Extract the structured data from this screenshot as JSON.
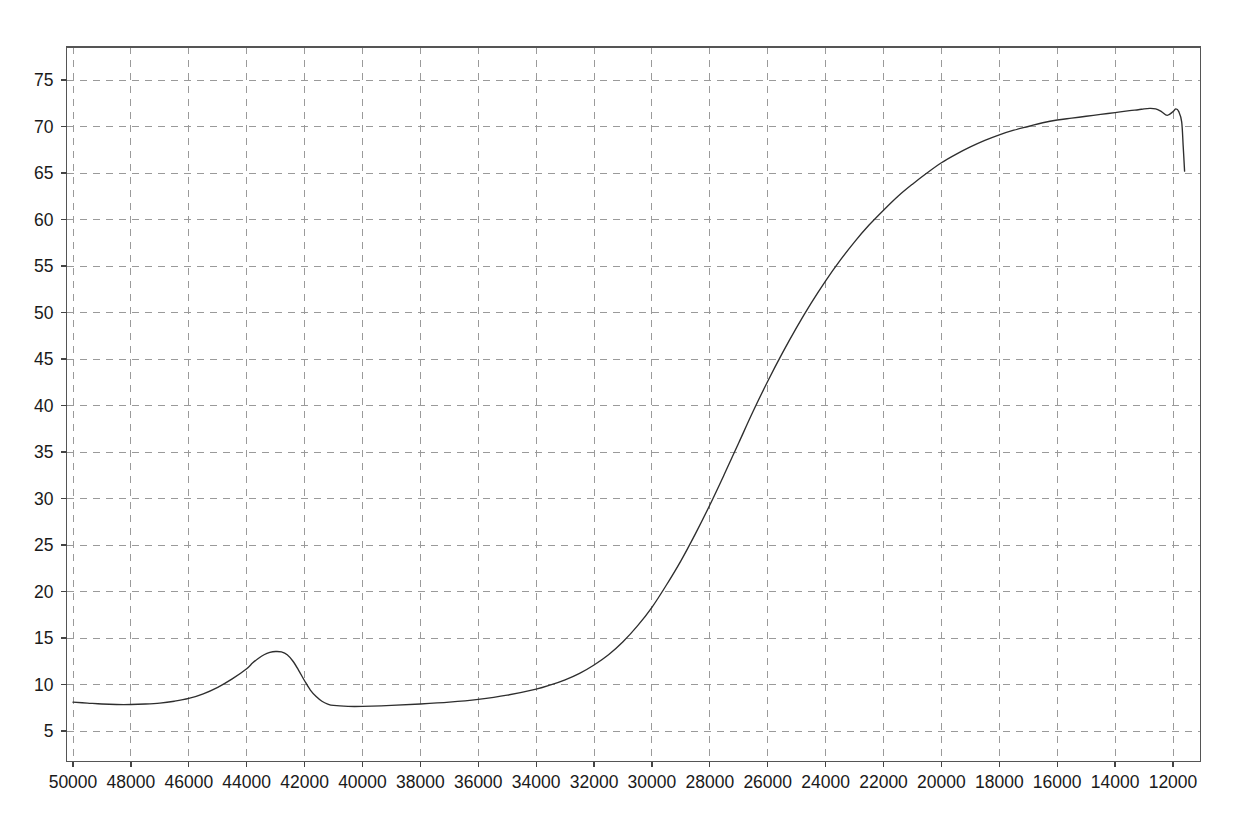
{
  "chart_data": {
    "type": "line",
    "title": "",
    "subtitle": "",
    "xlabel": "",
    "ylabel": "",
    "xlim": [
      50000,
      11600
    ],
    "ylim": [
      0.8,
      77.5
    ],
    "x_reversed": true,
    "grid": true,
    "legend": null,
    "legend_position": "none",
    "x_ticks": [
      50000,
      48000,
      46000,
      44000,
      42000,
      40000,
      38000,
      36000,
      34000,
      32000,
      30000,
      28000,
      26000,
      24000,
      22000,
      20000,
      18000,
      16000,
      14000,
      12000
    ],
    "x_tick_labels": [
      "50000",
      "48000",
      "46000",
      "44000",
      "42000",
      "40000",
      "38000",
      "36000",
      "34000",
      "32000",
      "30000",
      "28000",
      "26000",
      "24000",
      "22000",
      "20000",
      "18000",
      "16000",
      "14000",
      "12000"
    ],
    "y_ticks": [
      5,
      10,
      15,
      20,
      25,
      30,
      35,
      40,
      45,
      50,
      55,
      60,
      65,
      70,
      75
    ],
    "y_tick_labels": [
      "5",
      "10",
      "15",
      "20",
      "25",
      "30",
      "35",
      "40",
      "45",
      "50",
      "55",
      "60",
      "65",
      "70",
      "75"
    ],
    "series": [
      {
        "name": "spectrum",
        "color": "#2e2e2e",
        "x": [
          50000,
          49500,
          49000,
          48500,
          48000,
          47500,
          47000,
          46500,
          46000,
          45500,
          45000,
          44500,
          44000,
          43800,
          43600,
          43400,
          43200,
          43000,
          42800,
          42600,
          42400,
          42200,
          42000,
          41800,
          41600,
          41400,
          41200,
          41000,
          40500,
          40000,
          39000,
          38000,
          37000,
          36000,
          35000,
          34000,
          33500,
          33000,
          32500,
          32000,
          31500,
          31000,
          30500,
          30000,
          29500,
          29000,
          28500,
          28000,
          27500,
          27000,
          26500,
          26000,
          25500,
          25000,
          24500,
          24000,
          23500,
          23000,
          22500,
          22000,
          21500,
          21000,
          20500,
          20000,
          19500,
          19000,
          18500,
          18000,
          17500,
          17000,
          16500,
          16000,
          15500,
          15000,
          14500,
          14000,
          13500,
          13200,
          13000,
          12800,
          12600,
          12400,
          12200,
          12000,
          11900,
          11800,
          11700,
          11650,
          11600
        ],
        "y": [
          8.1,
          8.0,
          7.9,
          7.85,
          7.85,
          7.9,
          8.0,
          8.2,
          8.5,
          9.0,
          9.7,
          10.6,
          11.7,
          12.3,
          12.8,
          13.2,
          13.45,
          13.55,
          13.5,
          13.2,
          12.5,
          11.5,
          10.4,
          9.4,
          8.7,
          8.2,
          7.9,
          7.75,
          7.65,
          7.65,
          7.75,
          7.9,
          8.1,
          8.4,
          8.85,
          9.5,
          9.95,
          10.5,
          11.2,
          12.1,
          13.2,
          14.6,
          16.3,
          18.3,
          20.7,
          23.3,
          26.2,
          29.3,
          32.6,
          36.0,
          39.4,
          42.6,
          45.6,
          48.4,
          51.0,
          53.4,
          55.6,
          57.6,
          59.4,
          61.0,
          62.5,
          63.8,
          65.0,
          66.1,
          67.0,
          67.8,
          68.5,
          69.1,
          69.6,
          70.0,
          70.4,
          70.7,
          70.9,
          71.1,
          71.3,
          71.5,
          71.7,
          71.8,
          71.9,
          71.95,
          71.9,
          71.6,
          71.2,
          71.6,
          71.9,
          71.6,
          70.5,
          68.0,
          65.2
        ]
      }
    ],
    "annotations": []
  },
  "axes": {
    "x_axis_name": "x-axis",
    "y_axis_name": "y-axis"
  }
}
